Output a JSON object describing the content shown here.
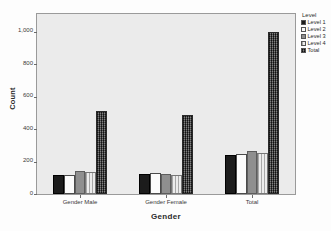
{
  "chart_data": {
    "type": "bar",
    "title": "",
    "xlabel": "Gender",
    "ylabel": "Count",
    "categories": [
      "Gender Male",
      "Gender Female",
      "Total"
    ],
    "series": [
      {
        "name": "Level 1",
        "values": [
          115,
          125,
          240
        ],
        "fill": "solid-black"
      },
      {
        "name": "Level 2",
        "values": [
          118,
          132,
          248
        ],
        "fill": "solid-white"
      },
      {
        "name": "Level 3",
        "values": [
          145,
          122,
          265
        ],
        "fill": "solid-gray"
      },
      {
        "name": "Level 4",
        "values": [
          138,
          118,
          255
        ],
        "fill": "vertical-hatch"
      },
      {
        "name": "Total",
        "values": [
          510,
          490,
          1000
        ],
        "fill": "dark-checker"
      }
    ],
    "ylim": [
      0,
      1110
    ],
    "yticks": [
      0,
      200,
      400,
      600,
      800,
      1000
    ],
    "ytick_labels": [
      "0",
      "200",
      "400",
      "600",
      "800",
      "1,000"
    ],
    "grid": false,
    "legend_position": "right",
    "legend_title": "Level"
  },
  "legend": {
    "title": "Level",
    "entries": [
      {
        "label": "Level 1"
      },
      {
        "label": "Level 2"
      },
      {
        "label": "Level 3"
      },
      {
        "label": "Level 4"
      },
      {
        "label": "Total"
      }
    ]
  },
  "axes": {
    "y_title": "Count",
    "x_title": "Gender"
  },
  "title_strip": ""
}
